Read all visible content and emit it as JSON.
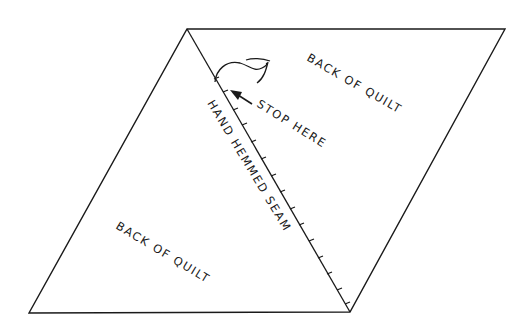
{
  "diagram": {
    "type": "quilt-seam-illustration",
    "colors": {
      "line": "#1a1a1a",
      "background": "#ffffff"
    },
    "shape": {
      "parallelogram": [
        [
          187,
          29
        ],
        [
          505,
          29
        ],
        [
          350,
          312
        ],
        [
          29,
          313
        ]
      ],
      "seam": {
        "from": [
          187,
          29
        ],
        "to": [
          350,
          312
        ],
        "style": "stitched"
      }
    },
    "labels": {
      "back_upper": "BACK OF QUILT",
      "stop_here": "STOP HERE",
      "seam": "HAND HEMMED SEAM",
      "back_lower": "BACK OF QUILT"
    },
    "annotations": {
      "arrow": "arrow pointing to seam stop point",
      "thread": "loose thread curl at top of seam"
    }
  }
}
